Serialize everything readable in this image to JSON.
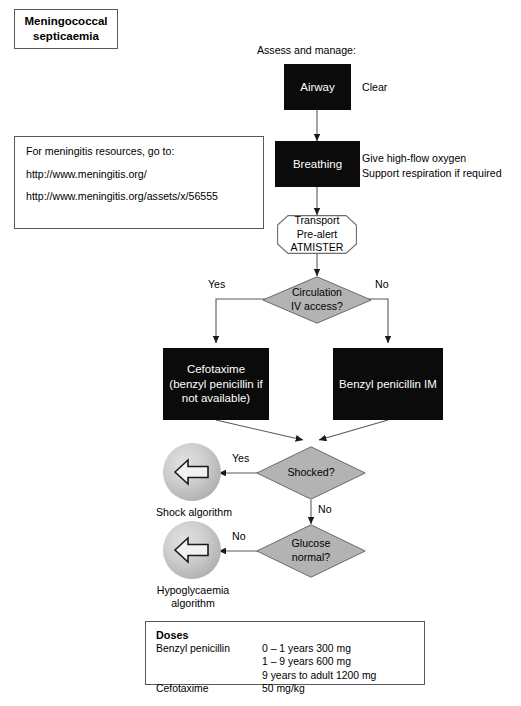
{
  "page": {
    "title_box": "Meningococcal septicaemia",
    "assess_label": "Assess and manage:"
  },
  "resources": {
    "line1": "For meningitis resources, go to:",
    "line2": "http://www.meningitis.org/",
    "line3": "http://www.meningitis.org/assets/x/56555"
  },
  "flow": {
    "airway": "Airway",
    "airway_note": "Clear",
    "breathing": "Breathing",
    "breathing_note_1": "Give high-flow oxygen",
    "breathing_note_2": "Support respiration if required",
    "transport_1": "Transport",
    "transport_2": "Pre-alert",
    "transport_3": "ATMISTER",
    "circulation_1": "Circulation",
    "circulation_2": "IV access?",
    "circulation_yes": "Yes",
    "circulation_no": "No",
    "cefotaxime_1": "Cefotaxime",
    "cefotaxime_2": "(benzyl penicillin if",
    "cefotaxime_3": "not available)",
    "benzyl_im": "Benzyl penicillin IM",
    "shocked": "Shocked?",
    "shocked_yes": "Yes",
    "shocked_no": "No",
    "shock_algorithm": "Shock algorithm",
    "glucose_1": "Glucose",
    "glucose_2": "normal?",
    "glucose_no": "No",
    "hypo_algorithm_1": "Hypoglycaemia",
    "hypo_algorithm_2": "algorithm"
  },
  "doses": {
    "heading": "Doses",
    "rows": [
      {
        "name": "Benzyl penicillin",
        "values": [
          "0 – 1 years 300 mg",
          "1 – 9 years 600 mg",
          "9 years to adult 1200 mg"
        ]
      },
      {
        "name": "Cefotaxime",
        "values": [
          "50 mg/kg"
        ]
      }
    ]
  },
  "colors": {
    "box_black": "#0b0b0b",
    "decision_gray": "#b3b3b3",
    "circle_gray": "#c8c8c8",
    "line": "#58585a"
  }
}
